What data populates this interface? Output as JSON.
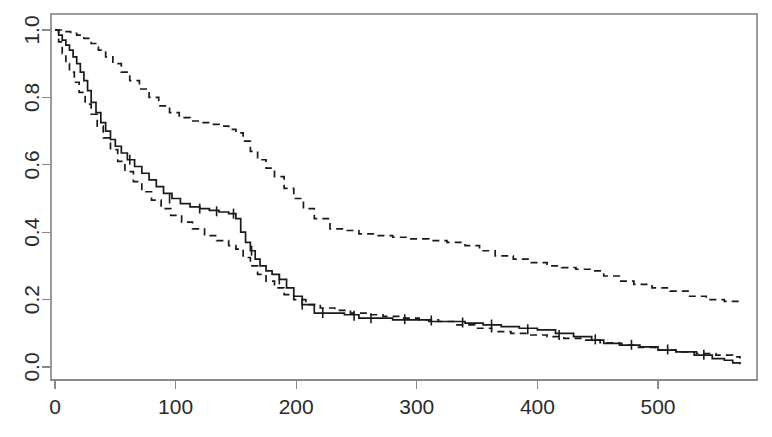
{
  "chart_data": {
    "type": "line",
    "title": "",
    "subtitle": "",
    "xlabel": "",
    "ylabel": "",
    "xlim": [
      -8,
      568
    ],
    "ylim": [
      -0.035,
      1.04
    ],
    "xticks": [
      0,
      100,
      200,
      300,
      400,
      500
    ],
    "yticks": [
      0.0,
      0.2,
      0.4,
      0.6,
      0.8,
      1.0
    ],
    "xtick_labels": [
      "0",
      "100",
      "200",
      "300",
      "400",
      "500"
    ],
    "ytick_labels": [
      "0.0",
      "0.2",
      "0.4",
      "0.6",
      "0.8",
      "1.0"
    ],
    "ytick_label_rotation": -90,
    "grid": false,
    "legend": "none",
    "frame": "box",
    "step_type": "post",
    "colors": {
      "estimate": "#1a1a1a",
      "confidence_band": "#1a1a1a",
      "axis": "#8a8a8a",
      "background": "#ffffff"
    },
    "series": [
      {
        "name": "survival_estimate",
        "style": "solid",
        "x": [
          0,
          3,
          6,
          9,
          12,
          15,
          18,
          21,
          24,
          27,
          30,
          34,
          38,
          42,
          46,
          50,
          55,
          60,
          66,
          72,
          78,
          84,
          90,
          97,
          104,
          112,
          120,
          128,
          136,
          144,
          150,
          154,
          158,
          162,
          166,
          170,
          175,
          180,
          186,
          192,
          198,
          205,
          215,
          228,
          240,
          252,
          265,
          280,
          295,
          310,
          325,
          340,
          355,
          370,
          385,
          400,
          415,
          430,
          445,
          455,
          470,
          485,
          500,
          515,
          530,
          545,
          555,
          562,
          568
        ],
        "y": [
          1.0,
          0.985,
          0.97,
          0.955,
          0.94,
          0.92,
          0.9,
          0.875,
          0.85,
          0.82,
          0.785,
          0.755,
          0.725,
          0.7,
          0.675,
          0.655,
          0.635,
          0.615,
          0.595,
          0.575,
          0.555,
          0.535,
          0.515,
          0.5,
          0.485,
          0.475,
          0.47,
          0.465,
          0.46,
          0.455,
          0.44,
          0.4,
          0.37,
          0.345,
          0.32,
          0.3,
          0.285,
          0.275,
          0.26,
          0.235,
          0.21,
          0.185,
          0.16,
          0.16,
          0.155,
          0.145,
          0.145,
          0.14,
          0.14,
          0.135,
          0.135,
          0.13,
          0.125,
          0.12,
          0.115,
          0.11,
          0.1,
          0.09,
          0.08,
          0.07,
          0.065,
          0.06,
          0.05,
          0.045,
          0.035,
          0.025,
          0.02,
          0.012,
          0.008
        ]
      },
      {
        "name": "upper_confidence_limit",
        "style": "dashed",
        "x": [
          0,
          4,
          8,
          13,
          18,
          24,
          30,
          36,
          42,
          48,
          55,
          62,
          70,
          78,
          86,
          95,
          103,
          112,
          120,
          128,
          136,
          144,
          150,
          156,
          162,
          168,
          175,
          182,
          190,
          198,
          206,
          215,
          228,
          240,
          252,
          265,
          280,
          295,
          310,
          325,
          340,
          352,
          365,
          380,
          395,
          408,
          420,
          432,
          445,
          455,
          468,
          480,
          495,
          510,
          525,
          540,
          555,
          568
        ],
        "y": [
          1.0,
          1.0,
          0.995,
          0.99,
          0.985,
          0.975,
          0.96,
          0.94,
          0.92,
          0.9,
          0.875,
          0.85,
          0.825,
          0.8,
          0.775,
          0.755,
          0.74,
          0.73,
          0.725,
          0.72,
          0.715,
          0.705,
          0.695,
          0.67,
          0.64,
          0.615,
          0.59,
          0.565,
          0.53,
          0.5,
          0.47,
          0.44,
          0.41,
          0.405,
          0.395,
          0.39,
          0.385,
          0.38,
          0.375,
          0.37,
          0.36,
          0.345,
          0.33,
          0.32,
          0.31,
          0.3,
          0.295,
          0.29,
          0.285,
          0.27,
          0.255,
          0.245,
          0.235,
          0.225,
          0.21,
          0.2,
          0.195,
          0.19
        ]
      },
      {
        "name": "lower_confidence_limit",
        "style": "dashed",
        "x": [
          0,
          3,
          6,
          9,
          12,
          16,
          20,
          25,
          30,
          35,
          40,
          46,
          52,
          58,
          65,
          72,
          80,
          88,
          96,
          105,
          114,
          124,
          134,
          144,
          150,
          156,
          162,
          168,
          175,
          182,
          190,
          198,
          208,
          220,
          232,
          245,
          258,
          272,
          288,
          302,
          318,
          332,
          348,
          362,
          378,
          392,
          408,
          422,
          438,
          452,
          468,
          482,
          498,
          515,
          532,
          548,
          562,
          568
        ],
        "y": [
          1.0,
          0.965,
          0.93,
          0.9,
          0.875,
          0.845,
          0.815,
          0.78,
          0.75,
          0.715,
          0.68,
          0.645,
          0.61,
          0.58,
          0.55,
          0.52,
          0.495,
          0.47,
          0.45,
          0.43,
          0.41,
          0.39,
          0.375,
          0.36,
          0.35,
          0.325,
          0.3,
          0.275,
          0.255,
          0.235,
          0.215,
          0.2,
          0.185,
          0.175,
          0.168,
          0.16,
          0.155,
          0.15,
          0.145,
          0.14,
          0.135,
          0.125,
          0.115,
          0.105,
          0.1,
          0.095,
          0.09,
          0.085,
          0.08,
          0.072,
          0.065,
          0.058,
          0.05,
          0.045,
          0.04,
          0.035,
          0.03,
          0.025
        ]
      }
    ],
    "censor_marks": {
      "name": "censoring-ticks",
      "x": [
        62,
        95,
        120,
        134,
        148,
        163,
        186,
        205,
        222,
        248,
        262,
        290,
        312,
        338,
        362,
        392,
        418,
        448,
        478,
        508,
        538
      ],
      "y": [
        0.615,
        0.5,
        0.47,
        0.462,
        0.455,
        0.345,
        0.26,
        0.185,
        0.16,
        0.152,
        0.145,
        0.142,
        0.138,
        0.132,
        0.126,
        0.112,
        0.095,
        0.082,
        0.066,
        0.052,
        0.036
      ]
    },
    "plot_area_px": {
      "left": 51,
      "right": 757,
      "top": 14,
      "bottom": 380
    }
  }
}
